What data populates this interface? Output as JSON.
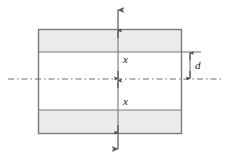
{
  "figure": {
    "type": "engineering-cross-section-diagram",
    "labels": {
      "x_upper": "x",
      "x_lower": "x",
      "d": "d"
    },
    "colors": {
      "shaded_band_fill": "#ebebeb",
      "web_fill": "#ffffff",
      "outline": "#7a7a7a",
      "dimension_line": "#55555a",
      "centerline": "#6e6e76",
      "label_text": "#1a1a1a",
      "background": "#ffffff"
    },
    "geometry": {
      "plate_left": 38,
      "plate_right": 182,
      "plate_top": 29,
      "plate_bottom": 134,
      "upper_band_bottom": 52,
      "lower_band_top": 110,
      "centerline_y": 79,
      "vertical_dim_x": 118,
      "d_dim_x": 190,
      "top_arrow_tip_y": 8,
      "bottom_arrow_tip_y": 151
    },
    "elements": [
      "top-load-arrow",
      "bottom-load-arrow",
      "upper-shaded-band",
      "lower-shaded-band",
      "plate-outline",
      "horizontal-centerline",
      "vertical-dimension-line",
      "d-dimension-line",
      "d-extension-line"
    ]
  }
}
